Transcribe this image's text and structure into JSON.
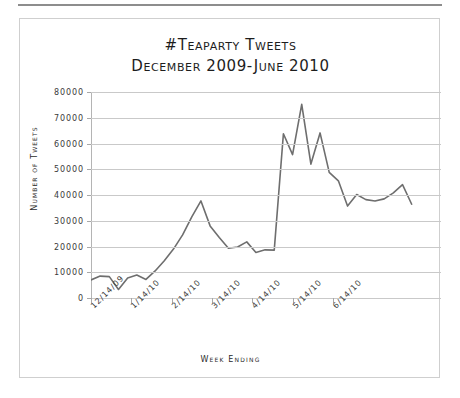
{
  "chart_data": {
    "type": "line",
    "title": "#Teaparty Tweets",
    "subtitle": "December 2009-June 2010",
    "xlabel": "Week Ending",
    "ylabel": "Number of Tweets",
    "ylim": [
      0,
      80000
    ],
    "ytick_labels": [
      "80000",
      "70000",
      "60000",
      "50000",
      "40000",
      "30000",
      "20000",
      "10000",
      "0"
    ],
    "ytick_values": [
      80000,
      70000,
      60000,
      50000,
      40000,
      30000,
      20000,
      10000,
      0
    ],
    "xtick_labels": [
      "12/14/09",
      "1/14/10",
      "2/14/10",
      "3/14/10",
      "4/14/10",
      "5/14/10",
      "6/14/10"
    ],
    "xtick_index": [
      0,
      4.4,
      8.8,
      13.2,
      17.6,
      22.0,
      26.4
    ],
    "grid": "horizontal",
    "legend": "none",
    "line_color": "#6e6e6e",
    "series": [
      {
        "name": "#teaparty tweets",
        "values": [
          7000,
          8500,
          8300,
          3300,
          7800,
          8900,
          7200,
          10500,
          14500,
          19000,
          24500,
          31500,
          37700,
          28000,
          23500,
          19300,
          19800,
          21800,
          17700,
          18700,
          18600,
          63800,
          55700,
          75200,
          52000,
          64100,
          48800,
          45500,
          35700,
          40200,
          38200,
          37700,
          38500,
          40800,
          44000,
          36400
        ]
      }
    ]
  },
  "axis": {
    "xtick_count": 7,
    "ytick_count": 9
  }
}
